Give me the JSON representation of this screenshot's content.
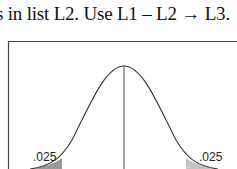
{
  "text": {
    "line": "s in list L2.  Use L1 – L2 → L3."
  },
  "figure": {
    "type": "normal-distribution-curve",
    "left_tail_label": ".025",
    "right_tail_label": ".025",
    "shade_color": "#9a9a9a",
    "line_color": "#333333"
  }
}
